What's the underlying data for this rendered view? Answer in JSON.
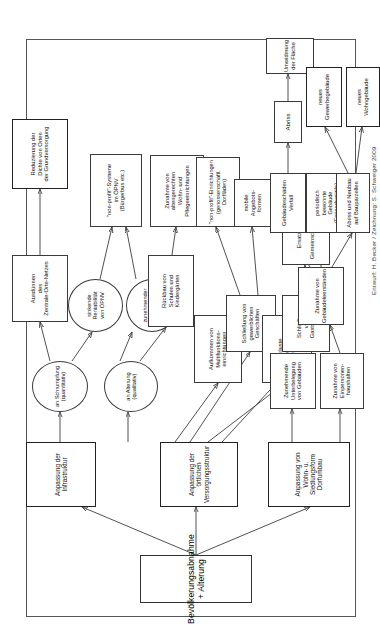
{
  "diagram": {
    "title": "Bevölkerungsabnahme + Alterung",
    "credit": "Entwurf: H. Becker / Zeichnung: S. Schweiger 2009",
    "type": "flow-chart",
    "orientation": "rotated-90-ccw",
    "nodes": {
      "root": "Bevölkerungsabnahme + Alterung",
      "infra": "Anpassung der Infrastruktur",
      "versorgung": "Anpassung der örtlichen\nVersorgungsstruktur",
      "wohnform": "Anpassung von\nWohn- u. Siedlungsform\nDorfumbau",
      "schrumpfung": "an Schrumpfung\n(quantitativ)",
      "alterung": "an Alterung\n(qualitativ)",
      "rentabilitaet": "sinkende\nRentabilität\nvon ÖPNV",
      "bedarf_oepnv": "zunehmender\nBedarf\nan ÖPNV",
      "ausduennen": "Ausdünnen\ndes\nZentrale-Orte-Netzes",
      "reduzierung": "Reduzierung der\nDichte von Orten\nder Grundversorgung",
      "nonprofit_oepnv": "\"non-profit\"-Systeme\nim ÖPNV\n(Bürgerbus etc.)",
      "rueckbau": "Rückbau von\nSchulen und\nKindergärten",
      "altengerecht": "Zunahme von\naltengerechten\nWohn- und\nPflegeeinrichtungen",
      "multifunktion": "Aufkommen von\nMultifunktions-\neinrichtungen",
      "schliessung_gewerbe": "Schließung von\ngewerblichen\nGeschäften",
      "nonprofit_doerfladen": "\"non-profit\"-Einrichtungen\n(genossenschaftl.\nDorfläden)",
      "mobile_angebote": "mobile\nAngebots-\nformen",
      "verluste": "Verluste\n(Pfarrstelle, Schule,\nVerwaltung etc.)",
      "schliessung_gast": "Schließung\nvon\nGaststätten",
      "ersatznutzung": "Ersatznutzung\nin\nGemeinschaftsräumen",
      "unterbelegung": "Zunehmende\nUnterbelegung\nvon Gebäuden",
      "einpersonen": "Zunahme von\nEinpersonen-\nhaushalten",
      "leerstaende": "Zunahme von\nGebäudeleerständen",
      "verfall": "Gebäudeschäden\nVerfall",
      "periodisch": "periodisch\nbewohnte\nGebäude\n(Feriendomizile)",
      "abriss_neubau": "Abriss und Neubau\nauf Bauparzellen",
      "abriss": "Abriss",
      "umwidmung": "Umwidmung der Fläche",
      "neues_gewerbe": "neues\nGewerbegebäude",
      "neues_wohn": "neues\nWohngebäude"
    }
  }
}
